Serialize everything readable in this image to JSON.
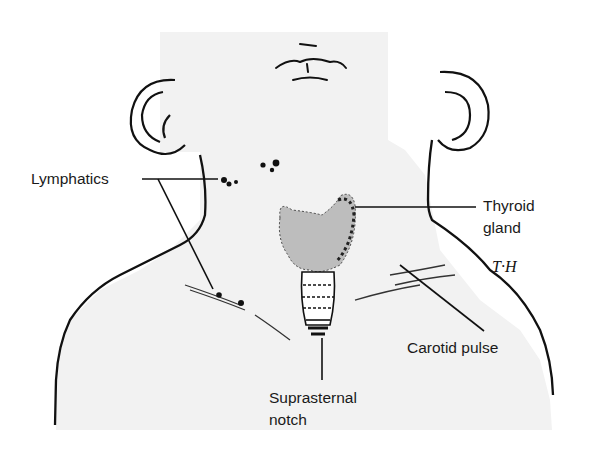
{
  "figure": {
    "credit_initials": "T.H."
  },
  "labels": {
    "lymphatics": "Lymphatics",
    "thyroid_line1": "Thyroid",
    "thyroid_line2": "gland",
    "carotid": "Carotid pulse",
    "suprasternal_line1": "Suprasternal",
    "suprasternal_line2": "notch"
  },
  "colors": {
    "background": "#ffffff",
    "skin": "#f2f2f2",
    "ink": "#111111",
    "thyroid_shade": "#b8b8b8"
  }
}
